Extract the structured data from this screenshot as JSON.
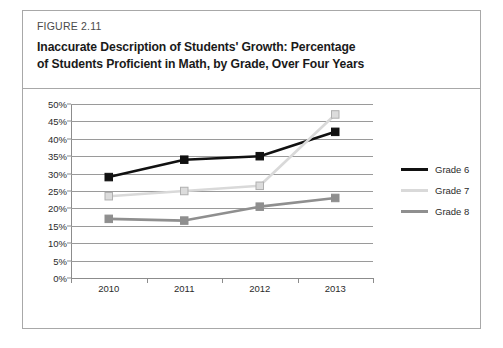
{
  "figure": {
    "label": "FIGURE 2.11",
    "title_line1": "Inaccurate Description of Students' Growth: Percentage",
    "title_line2": "of Students Proficient in Math, by Grade, Over Four Years"
  },
  "chart_data": {
    "type": "line",
    "title": "Inaccurate Description of Students' Growth: Percentage of Students Proficient in Math, by Grade, Over Four Years",
    "xlabel": "",
    "ylabel": "",
    "categories": [
      "2010",
      "2011",
      "2012",
      "2013"
    ],
    "ylim": [
      0,
      50
    ],
    "ytick_labels": [
      "0%",
      "5%",
      "10%",
      "15%",
      "20%",
      "25%",
      "30%",
      "35%",
      "40%",
      "45%",
      "50%"
    ],
    "ytick_values": [
      0,
      5,
      10,
      15,
      20,
      25,
      30,
      35,
      40,
      45,
      50
    ],
    "grid": true,
    "legend_position": "right",
    "markers": "square",
    "series": [
      {
        "name": "Grade 6",
        "values": [
          29,
          34,
          35,
          42
        ],
        "color": "#111111",
        "marker_fill": "#111111",
        "marker_stroke": "#111111"
      },
      {
        "name": "Grade 7",
        "values": [
          23.5,
          25,
          26.5,
          47
        ],
        "color": "#d9d9d9",
        "marker_fill": "#dcdcdc",
        "marker_stroke": "#b0b0b0"
      },
      {
        "name": "Grade 8",
        "values": [
          17,
          16.5,
          20.5,
          23
        ],
        "color": "#8f8f8f",
        "marker_fill": "#8f8f8f",
        "marker_stroke": "#8f8f8f"
      }
    ]
  },
  "colors": {
    "border": "#a8a8a8",
    "gridline": "#9a9a9a",
    "axis": "#8c8c8c",
    "text": "#2b2b2b"
  }
}
